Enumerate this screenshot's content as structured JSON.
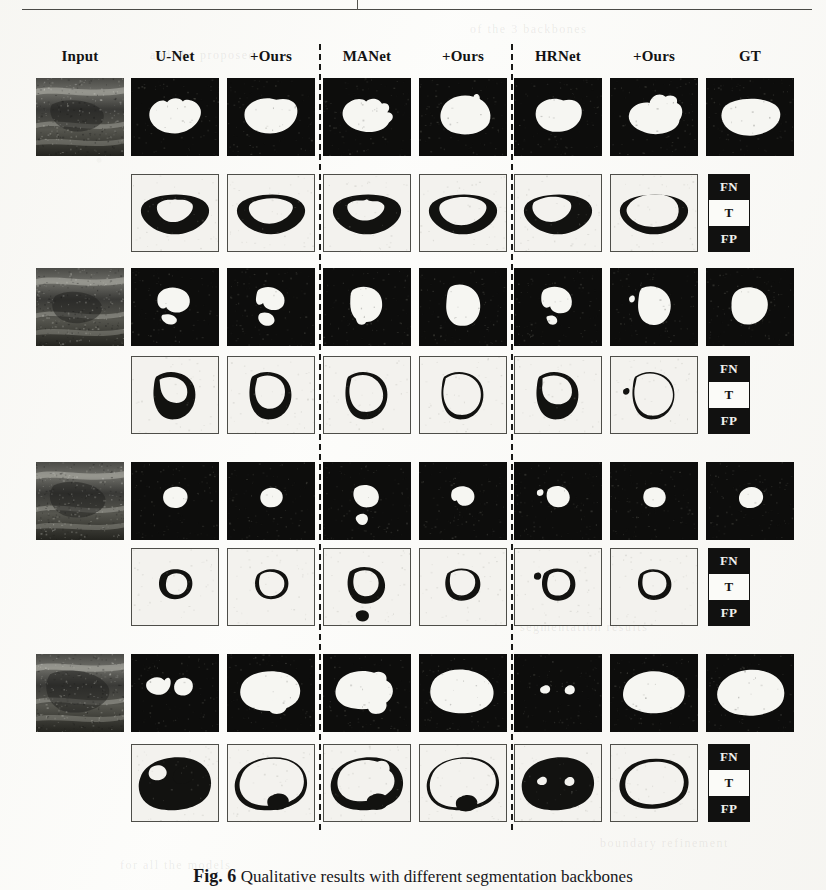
{
  "figure": {
    "caption_label": "Fig. 6",
    "caption_text": "Qualitative results with different segmentation backbones",
    "background_color": "#fdfdfb"
  },
  "columns": [
    {
      "label": "Input",
      "type": "ultrasound"
    },
    {
      "label": "U-Net",
      "type": "prediction"
    },
    {
      "label": "+Ours",
      "type": "prediction"
    },
    {
      "label": "MANet",
      "type": "prediction"
    },
    {
      "label": "+Ours",
      "type": "prediction"
    },
    {
      "label": "HRNet",
      "type": "prediction"
    },
    {
      "label": "+Ours",
      "type": "prediction"
    },
    {
      "label": "GT",
      "type": "groundtruth"
    }
  ],
  "separators": [
    {
      "after_column": 3
    },
    {
      "after_column": 5
    }
  ],
  "legend": {
    "cells": [
      {
        "label": "FN",
        "style": "dark",
        "color": "#111110"
      },
      {
        "label": "T",
        "style": "light",
        "color": "#fbfbf8"
      },
      {
        "label": "FP",
        "style": "dark",
        "color": "#111110"
      }
    ]
  },
  "colors": {
    "mask_foreground": "#f6f6f2",
    "mask_background": "#0d0d0c",
    "error_background": "#f3f2ee",
    "error_region": "#121210",
    "panel_border": "#4e4e49",
    "separator": "#1a1a18",
    "header_text": "#131313"
  },
  "cases": [
    {
      "id": 1,
      "row_segmentation_label": "segmentation",
      "row_error_label": "error-map"
    },
    {
      "id": 2,
      "row_segmentation_label": "segmentation",
      "row_error_label": "error-map"
    },
    {
      "id": 3,
      "row_segmentation_label": "segmentation",
      "row_error_label": "error-map"
    },
    {
      "id": 4,
      "row_segmentation_label": "segmentation",
      "row_error_label": "error-map"
    }
  ],
  "bleed_text": [
    {
      "text": "of the 3 backbones",
      "x": 470,
      "y": 22
    },
    {
      "text": "and the proposed",
      "x": 150,
      "y": 48
    },
    {
      "text": "segmentation results",
      "x": 520,
      "y": 620
    },
    {
      "text": "comparison",
      "x": 40,
      "y": 700
    },
    {
      "text": "boundary refinement",
      "x": 600,
      "y": 836
    },
    {
      "text": "for all the models",
      "x": 120,
      "y": 858
    }
  ]
}
